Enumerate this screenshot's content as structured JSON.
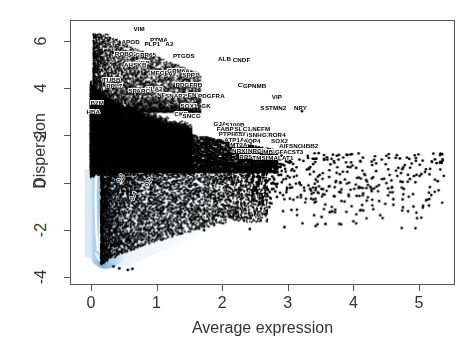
{
  "chart_data": {
    "type": "scatter",
    "title": "",
    "xlabel": "Average expression",
    "ylabel": "Dispersion",
    "xlim": [
      -0.32,
      5.55
    ],
    "ylim": [
      -4.35,
      6.9
    ],
    "xticks": [
      0,
      1,
      2,
      3,
      4,
      5
    ],
    "yticks": [
      -4,
      -2,
      0,
      2,
      4,
      6
    ],
    "xtick_labels": [
      "0",
      "1",
      "2",
      "3",
      "4",
      "5"
    ],
    "ytick_labels": [
      "-4",
      "-2",
      "0",
      "2",
      "4",
      "6"
    ],
    "grid": false,
    "legend": "none",
    "point_color": "#000000",
    "density_color": "#b3d3e8",
    "contour_color": "#ffffff",
    "frame_color": "#555555",
    "contour_labels": [
      {
        "text": "0.2",
        "x": 0.42,
        "y": 0.22
      },
      {
        "text": "0.2",
        "x": 0.86,
        "y": 0.05
      },
      {
        "text": "0.4",
        "x": 0.63,
        "y": -0.55
      }
    ],
    "annotations": [
      {
        "label": "VIM",
        "x": 0.72,
        "y": 6.55
      },
      {
        "label": "APOD",
        "x": 0.59,
        "y": 6.02
      },
      {
        "label": "PTMA",
        "x": 1.02,
        "y": 6.1
      },
      {
        "label": "PLP1",
        "x": 0.92,
        "y": 5.92
      },
      {
        "label": "A2",
        "x": 1.18,
        "y": 5.92
      },
      {
        "label": "ROBO2",
        "x": 0.52,
        "y": 5.52
      },
      {
        "label": "GPR65",
        "x": 0.82,
        "y": 5.46
      },
      {
        "label": "PTGDS",
        "x": 1.4,
        "y": 5.4
      },
      {
        "label": "ALB",
        "x": 2.02,
        "y": 5.28
      },
      {
        "label": "CNDF",
        "x": 2.28,
        "y": 5.26
      },
      {
        "label": "HBB",
        "x": 0.78,
        "y": 5.1
      },
      {
        "label": "AHSKB",
        "x": 0.66,
        "y": 5.05
      },
      {
        "label": "MFGE8",
        "x": 1.06,
        "y": 4.7
      },
      {
        "label": "GPM6A",
        "x": 1.32,
        "y": 4.76
      },
      {
        "label": "SPP1",
        "x": 1.5,
        "y": 4.6
      },
      {
        "label": "TUBB",
        "x": 0.3,
        "y": 4.38
      },
      {
        "label": "RPL7",
        "x": 0.34,
        "y": 4.15
      },
      {
        "label": "PDGFRB",
        "x": 1.48,
        "y": 4.2
      },
      {
        "label": "CPE",
        "x": 2.32,
        "y": 4.18
      },
      {
        "label": "GPNMB",
        "x": 2.48,
        "y": 4.16
      },
      {
        "label": "HLA2",
        "x": 0.95,
        "y": 4.02
      },
      {
        "label": "SPARC",
        "x": 0.72,
        "y": 3.92
      },
      {
        "label": "NEFL",
        "x": 1.12,
        "y": 3.76
      },
      {
        "label": "SNAP25",
        "x": 1.3,
        "y": 3.72
      },
      {
        "label": "ENPP2",
        "x": 1.62,
        "y": 3.74
      },
      {
        "label": "PDGFRA",
        "x": 1.82,
        "y": 3.72
      },
      {
        "label": "VIP",
        "x": 2.82,
        "y": 3.66
      },
      {
        "label": "B2M",
        "x": 0.08,
        "y": 3.42
      },
      {
        "label": "SOX1",
        "x": 1.48,
        "y": 3.3
      },
      {
        "label": "GK",
        "x": 1.74,
        "y": 3.3
      },
      {
        "label": "SST",
        "x": 2.66,
        "y": 3.22
      },
      {
        "label": "STMN2",
        "x": 2.8,
        "y": 3.2
      },
      {
        "label": "NPY",
        "x": 3.18,
        "y": 3.22
      },
      {
        "label": "HBA",
        "x": 0.02,
        "y": 3.05
      },
      {
        "label": "CKB",
        "x": 1.36,
        "y": 2.94
      },
      {
        "label": "SNCG",
        "x": 1.52,
        "y": 2.88
      },
      {
        "label": "GJA1",
        "x": 1.98,
        "y": 2.52
      },
      {
        "label": "S100B",
        "x": 2.18,
        "y": 2.5
      },
      {
        "label": "FABP7",
        "x": 2.06,
        "y": 2.32
      },
      {
        "label": "SLC1A3",
        "x": 2.36,
        "y": 2.3
      },
      {
        "label": "NEFM",
        "x": 2.58,
        "y": 2.3
      },
      {
        "label": "PTPRZ1",
        "x": 2.12,
        "y": 2.12
      },
      {
        "label": "TTYH1",
        "x": 2.32,
        "y": 2.1
      },
      {
        "label": "CLU",
        "x": 2.46,
        "y": 2.08
      },
      {
        "label": "SNHG14",
        "x": 2.58,
        "y": 2.06
      },
      {
        "label": "ROR4",
        "x": 2.82,
        "y": 2.08
      },
      {
        "label": "ATP1A2",
        "x": 2.2,
        "y": 1.86
      },
      {
        "label": "AQP4",
        "x": 2.44,
        "y": 1.8
      },
      {
        "label": "SOX2",
        "x": 2.86,
        "y": 1.82
      },
      {
        "label": "MT2A",
        "x": 2.24,
        "y": 1.62
      },
      {
        "label": "AIF1",
        "x": 2.96,
        "y": 1.6
      },
      {
        "label": "SNCA",
        "x": 3.14,
        "y": 1.6
      },
      {
        "label": "HBB2",
        "x": 3.32,
        "y": 1.58
      },
      {
        "label": "NRXN1",
        "x": 2.3,
        "y": 1.38
      },
      {
        "label": "NRGN",
        "x": 2.52,
        "y": 1.36
      },
      {
        "label": "MBP",
        "x": 2.72,
        "y": 1.34
      },
      {
        "label": "GFAP",
        "x": 2.92,
        "y": 1.34
      },
      {
        "label": "CST3",
        "x": 3.1,
        "y": 1.32
      },
      {
        "label": "RPS27",
        "x": 2.4,
        "y": 1.12
      },
      {
        "label": "TMSB4X",
        "x": 2.64,
        "y": 1.1
      },
      {
        "label": "MALAT1",
        "x": 2.88,
        "y": 1.08
      }
    ]
  },
  "axes": {
    "x_title": "Average expression",
    "y_title": "Dispersion"
  }
}
